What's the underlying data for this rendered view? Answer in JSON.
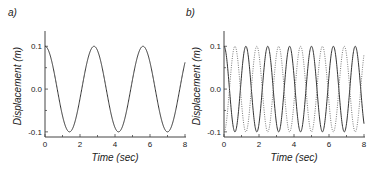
{
  "chart_data": [
    {
      "type": "line",
      "panel_label": "a)",
      "xlabel": "Time (sec)",
      "ylabel": "Displacement (m)",
      "xlim": [
        0,
        8
      ],
      "ylim": [
        -0.1,
        0.1
      ],
      "xticks": [
        "0",
        "2",
        "4",
        "6",
        "8"
      ],
      "yticks": [
        "-0.1",
        "0.0",
        "0.1"
      ],
      "grid": false,
      "series": [
        {
          "name": "displacement",
          "style": "solid",
          "color": "#333333",
          "function": "0.1*cos(2*pi*t/2.8)",
          "amplitude": 0.1,
          "period": 2.8,
          "phase": 0
        }
      ]
    },
    {
      "type": "line",
      "panel_label": "b)",
      "xlabel": "Time (sec)",
      "ylabel": "Displacement (m)",
      "xlim": [
        0,
        8
      ],
      "ylim": [
        -0.1,
        0.1
      ],
      "xticks": [
        "0",
        "2",
        "4",
        "6",
        "8"
      ],
      "yticks": [
        "-0.1",
        "0.0",
        "0.1"
      ],
      "grid": false,
      "series": [
        {
          "name": "mode-1",
          "style": "solid",
          "color": "#333333",
          "function": "0.1*cos(2*pi*t/1.25)",
          "amplitude": 0.1,
          "period": 1.25,
          "phase": 0
        },
        {
          "name": "mode-2",
          "style": "dotted",
          "color": "#777777",
          "function": "-0.1*cos(2*pi*t/1.25)",
          "amplitude": 0.1,
          "period": 1.25,
          "phase": 3.14159
        }
      ]
    }
  ]
}
